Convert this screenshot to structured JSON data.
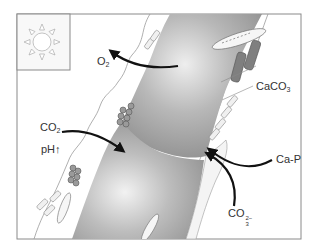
{
  "diagram": {
    "type": "biological schematic",
    "frame": {
      "x": 17,
      "y": 14,
      "width": 284,
      "height": 225,
      "stroke": "#8a8a8a"
    },
    "inset": {
      "name": "sun",
      "icon": "sun-icon",
      "x": 17,
      "y": 14,
      "width": 53,
      "height": 56
    },
    "colors": {
      "cell_fill_dark": "#8c8c8c",
      "cell_fill_light": "#e6e6e6",
      "arrow": "#111111",
      "sheath_line": "#9a9a9a",
      "crystal": "#777777",
      "text": "#333333"
    },
    "labels": {
      "o2": {
        "main": "O",
        "sub": "2"
      },
      "co2": {
        "main": "CO",
        "sub": "2"
      },
      "ph": {
        "main": "pH",
        "suffix": "↑"
      },
      "caco3": {
        "main": "CaCO",
        "sub": "3"
      },
      "cap": {
        "main": "Ca-P"
      },
      "co3": {
        "main": "CO",
        "sup": "2−",
        "sub": "3"
      }
    },
    "arrows": [
      {
        "name": "o2-release-arrow",
        "from": "cell",
        "to": "O2",
        "direction": "outward"
      },
      {
        "name": "co2-uptake-arrow",
        "from": "CO2",
        "to": "cell",
        "direction": "inward"
      },
      {
        "name": "cap-arrow",
        "from": "Ca-P",
        "to": "sheath",
        "direction": "inward"
      },
      {
        "name": "co3-arrow",
        "from": "CO3 2-",
        "to": "sheath",
        "direction": "inward"
      }
    ]
  }
}
